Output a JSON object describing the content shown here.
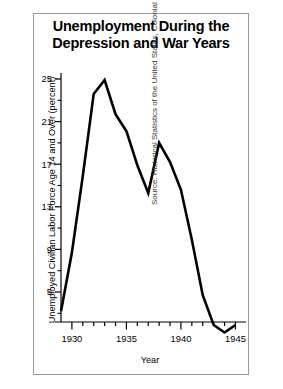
{
  "chart_data": {
    "type": "line",
    "title": "Unemployment During the Depression and War Years",
    "title_line1": "Unemployment During the",
    "title_line2": "Depression and War Years",
    "xlabel": "Year",
    "ylabel": "Unemployed Civilian Labor Force Age 14 and Over (percent)",
    "source": "Source: Historical Statistics of the United States, Colonial Times to 1970.",
    "grid": false,
    "legend": "none",
    "xlim": [
      1929,
      1945.6
    ],
    "ylim": [
      0,
      26.5
    ],
    "xticks": [
      1930,
      1935,
      1940,
      1945
    ],
    "xtick_labels": [
      "1930",
      "1935",
      "1940",
      "1945"
    ],
    "xminor_step": 1,
    "yticks": [
      5,
      9,
      13,
      17,
      21,
      25
    ],
    "ytick_labels": [
      "5",
      "9",
      "13",
      "17",
      "21",
      "25"
    ],
    "yminor_step": 2,
    "series_name": "Unemployment rate",
    "line_color": "#000000",
    "x": [
      1929,
      1930,
      1931,
      1932,
      1933,
      1934,
      1935,
      1936,
      1937,
      1938,
      1939,
      1940,
      1941,
      1942,
      1943,
      1944,
      1945
    ],
    "values": [
      3.2,
      8.7,
      15.9,
      23.6,
      24.9,
      21.7,
      20.1,
      16.9,
      14.3,
      19.0,
      17.2,
      14.6,
      9.9,
      4.7,
      1.9,
      1.2,
      1.9
    ]
  }
}
